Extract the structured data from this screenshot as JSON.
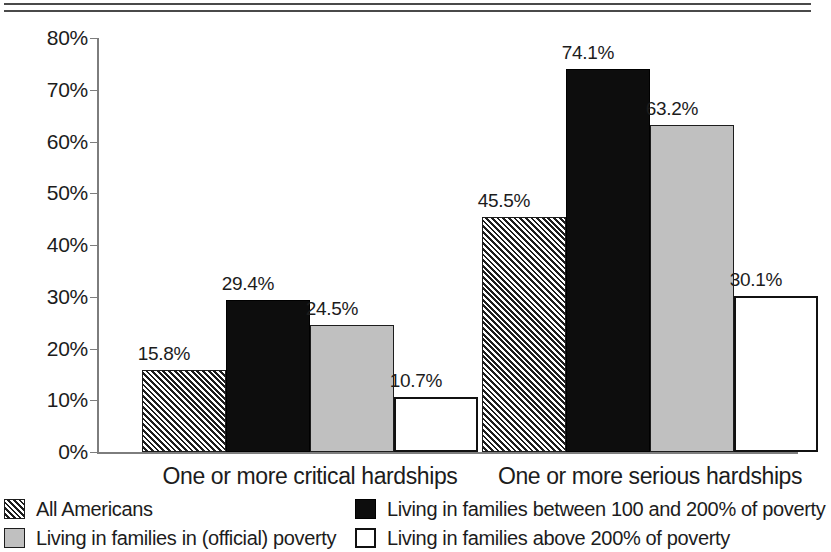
{
  "chart_data": {
    "type": "bar",
    "title": "",
    "subtitle": "",
    "xlabel": "",
    "ylabel": "",
    "ylim": [
      0,
      80
    ],
    "y_tick_labels": [
      "80%",
      "70%",
      "60%",
      "50%",
      "40%",
      "30%",
      "20%",
      "10%",
      "0%"
    ],
    "y_tick_values": [
      80,
      70,
      60,
      50,
      40,
      30,
      20,
      10,
      0
    ],
    "grid": false,
    "legend_position": "bottom",
    "categories": [
      "One or more critical hardships",
      "One or more serious hardships"
    ],
    "series": [
      {
        "name": "All Americans",
        "style": "hatch",
        "values": [
          15.8,
          63.2
        ],
        "labels": [
          "15.8%",
          "45.5%"
        ]
      },
      {
        "name": "Living in families between 100 and 200% of poverty",
        "style": "black",
        "values": [
          29.4,
          74.1
        ],
        "labels": [
          "29.4%",
          "74.1%"
        ]
      },
      {
        "name": "Living in families in (official) poverty",
        "style": "gray",
        "values": [
          24.5,
          63.2
        ],
        "labels": [
          "24.5%",
          "63.2%"
        ]
      },
      {
        "name": "Living in families above 200% of poverty",
        "style": "white",
        "values": [
          10.7,
          30.1
        ],
        "labels": [
          "10.7%",
          "30.1%"
        ]
      }
    ],
    "bars": [
      {
        "group": 0,
        "series": 0,
        "value": 15.8,
        "label": "15.8%",
        "style": "hatch"
      },
      {
        "group": 0,
        "series": 1,
        "value": 29.4,
        "label": "29.4%",
        "style": "black"
      },
      {
        "group": 0,
        "series": 2,
        "value": 24.5,
        "label": "24.5%",
        "style": "gray"
      },
      {
        "group": 0,
        "series": 3,
        "value": 10.7,
        "label": "10.7%",
        "style": "white"
      },
      {
        "group": 1,
        "series": 0,
        "value": 45.5,
        "label": "45.5%",
        "style": "hatch"
      },
      {
        "group": 1,
        "series": 1,
        "value": 74.1,
        "label": "74.1%",
        "style": "black"
      },
      {
        "group": 1,
        "series": 2,
        "value": 63.2,
        "label": "63.2%",
        "style": "gray"
      },
      {
        "group": 1,
        "series": 3,
        "value": 30.1,
        "label": "30.1%",
        "style": "white"
      }
    ]
  },
  "legend": {
    "items": [
      {
        "label": "All Americans",
        "style": "hatch"
      },
      {
        "label": "Living in families in (official) poverty",
        "style": "gray"
      },
      {
        "label": "Living in families between 100 and 200% of poverty",
        "style": "black"
      },
      {
        "label": "Living in families above 200% of poverty",
        "style": "white"
      }
    ]
  },
  "colors": {
    "hatch_fg": "#1d1d1d",
    "hatch_bg": "#ffffff",
    "black": "#0d0d0d",
    "gray": "#c0c0c0",
    "white": "#ffffff",
    "axis": "#7d7d7d",
    "rule": "#4a4a4a",
    "text": "#1c1c1c"
  }
}
